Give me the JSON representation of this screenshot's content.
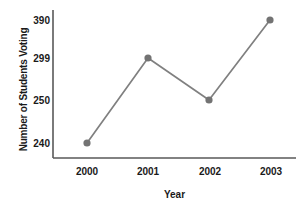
{
  "chart_data": {
    "type": "line",
    "title": "",
    "xlabel": "Year",
    "ylabel": "Number of Students Voting",
    "categories": [
      "2000",
      "2001",
      "2002",
      "2003"
    ],
    "values": [
      240,
      299,
      250,
      390
    ],
    "x_tick_labels": [
      "2000",
      "2001",
      "2002",
      "2003"
    ],
    "y_tick_labels": [
      "390",
      "299",
      "250",
      "240"
    ],
    "grid": false,
    "legend": null,
    "series": [
      {
        "name": "Number of Students Voting",
        "values": [
          240,
          299,
          250,
          390
        ]
      }
    ],
    "points": [
      {
        "x": "2000",
        "y": 240,
        "label": "240"
      },
      {
        "x": "2001",
        "y": 299,
        "label": "299"
      },
      {
        "x": "2002",
        "y": 250,
        "label": "250"
      },
      {
        "x": "2003",
        "y": 390,
        "label": "390"
      }
    ],
    "colors": {
      "line": "#808080",
      "marker": "#737373",
      "axis": "#595959",
      "text": "#1a1a1a",
      "background": "#ffffff"
    },
    "axis_note": "y tick values are unevenly valued but evenly spaced on axis"
  }
}
